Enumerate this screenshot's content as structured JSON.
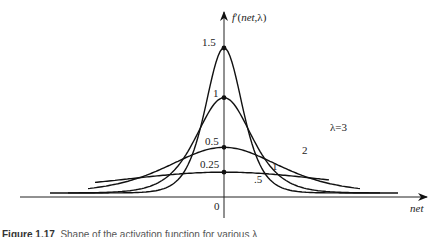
{
  "chart_data": {
    "type": "line",
    "title": "",
    "ylabel": "f'(net,λ)",
    "xlabel": "net",
    "origin_label": "0",
    "grid": false,
    "legend": "inline labels on curves",
    "series": [
      {
        "name": "λ=3",
        "label": "λ=3",
        "peak": 1.5,
        "peak_label": "1.5"
      },
      {
        "name": "λ=2",
        "label": "2",
        "peak": 1.0,
        "peak_label": "1"
      },
      {
        "name": "λ=1",
        "label": "1",
        "peak": 0.5,
        "peak_label": "0.5"
      },
      {
        "name": "λ=0.5",
        "label": ".5",
        "peak": 0.25,
        "peak_label": "0.25"
      }
    ],
    "formula_note": "f'(net) = λ/2 · (1 − f²), peak λ/2 at net=0"
  },
  "caption": {
    "figure": "Figure 1.17",
    "text": "Shape of the activation function for various λ"
  }
}
